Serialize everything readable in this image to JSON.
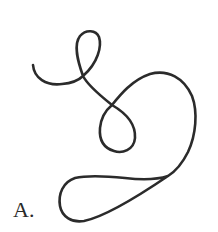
{
  "figure": {
    "label": "A.",
    "stroke_color": "#2b2b2b",
    "stroke_width": 2.6,
    "background": "#ffffff"
  }
}
